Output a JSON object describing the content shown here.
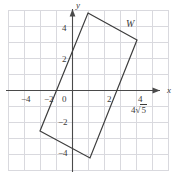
{
  "figure": {
    "background_color": "#ffffff",
    "grid_color": "#d9d9de",
    "axis_color": "#4a4a4a",
    "shape_color": "#3d3d3d",
    "text_color": "#3b3b3b"
  },
  "axes": {
    "x_name": "x",
    "y_name": "y",
    "origin_label": "0",
    "x_ticks": [
      {
        "value": -4,
        "label": "−4"
      },
      {
        "value": -2,
        "label": "−2"
      },
      {
        "value": 2,
        "label": "2"
      },
      {
        "value": 4,
        "label": "4"
      }
    ],
    "y_ticks": [
      {
        "value": 4,
        "label": "4"
      },
      {
        "value": 2,
        "label": "2"
      },
      {
        "value": -2,
        "label": "−2"
      },
      {
        "value": -4,
        "label": "−4"
      }
    ],
    "x_range": [
      -5,
      5
    ],
    "y_range": [
      -5,
      5
    ],
    "grid": true,
    "grid_step": 1
  },
  "shape": {
    "name": "W",
    "label": "W",
    "type": "rectangle",
    "vertices": [
      {
        "name": "top",
        "x": 1.0,
        "y": 4.8
      },
      {
        "name": "right",
        "x": 4.1,
        "y": 3.1
      },
      {
        "name": "bottom",
        "x": 1.1,
        "y": -4.1
      },
      {
        "name": "left",
        "x": -2.0,
        "y": -2.4
      }
    ]
  },
  "annotations": [
    {
      "name": "side-length-label",
      "text": "4√5",
      "coefficient": "4",
      "radicand": "5",
      "near_x": 4,
      "near_y": -0.7
    }
  ]
}
